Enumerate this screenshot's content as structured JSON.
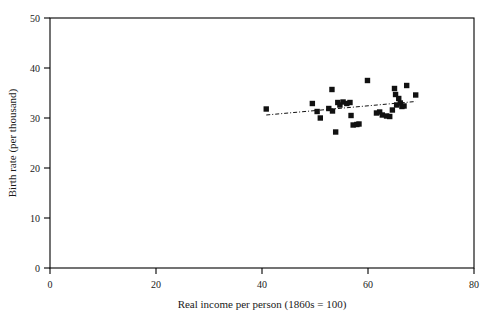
{
  "chart_data": {
    "type": "scatter",
    "title": "",
    "xlabel": "Real income per person (1860s = 100)",
    "ylabel": "Birth rate (per thousand)",
    "xlim": [
      0,
      80
    ],
    "ylim": [
      0,
      50
    ],
    "xticks": [
      0,
      20,
      40,
      60,
      80
    ],
    "yticks": [
      0,
      10,
      20,
      30,
      40,
      50
    ],
    "xtick_labels": [
      "0",
      "20",
      "40",
      "60",
      "80"
    ],
    "ytick_labels": [
      "0",
      "10",
      "20",
      "30",
      "40",
      "50"
    ],
    "grid": false,
    "legend": "none",
    "marker_style": "filled-square",
    "marker_color": "#111111",
    "points": [
      {
        "x": 40.8,
        "y": 31.8
      },
      {
        "x": 49.5,
        "y": 32.9
      },
      {
        "x": 50.4,
        "y": 31.3
      },
      {
        "x": 51.0,
        "y": 30.0
      },
      {
        "x": 52.6,
        "y": 31.9
      },
      {
        "x": 53.2,
        "y": 35.7
      },
      {
        "x": 53.3,
        "y": 31.4
      },
      {
        "x": 53.9,
        "y": 27.2
      },
      {
        "x": 54.3,
        "y": 33.1
      },
      {
        "x": 54.7,
        "y": 32.6
      },
      {
        "x": 55.3,
        "y": 33.2
      },
      {
        "x": 56.0,
        "y": 32.9
      },
      {
        "x": 56.6,
        "y": 33.1
      },
      {
        "x": 56.8,
        "y": 30.5
      },
      {
        "x": 57.2,
        "y": 28.6
      },
      {
        "x": 57.9,
        "y": 28.7
      },
      {
        "x": 58.3,
        "y": 28.8
      },
      {
        "x": 59.9,
        "y": 37.5
      },
      {
        "x": 61.6,
        "y": 31.0
      },
      {
        "x": 62.2,
        "y": 31.2
      },
      {
        "x": 62.7,
        "y": 30.6
      },
      {
        "x": 63.5,
        "y": 30.4
      },
      {
        "x": 64.1,
        "y": 30.3
      },
      {
        "x": 64.6,
        "y": 31.6
      },
      {
        "x": 65.0,
        "y": 35.9
      },
      {
        "x": 65.2,
        "y": 34.7
      },
      {
        "x": 65.4,
        "y": 32.6
      },
      {
        "x": 65.8,
        "y": 33.9
      },
      {
        "x": 66.1,
        "y": 33.0
      },
      {
        "x": 66.4,
        "y": 32.3
      },
      {
        "x": 66.8,
        "y": 32.4
      },
      {
        "x": 67.3,
        "y": 36.5
      },
      {
        "x": 69.0,
        "y": 34.6
      }
    ],
    "trendline": {
      "style": "dash-dot",
      "x_start": 40.8,
      "y_start": 30.6,
      "x_end": 69.0,
      "y_end": 33.3
    }
  }
}
